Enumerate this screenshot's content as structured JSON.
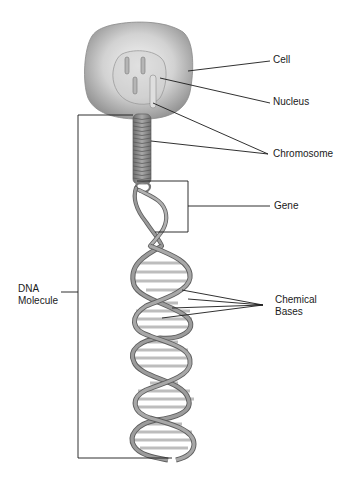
{
  "diagram": {
    "type": "biology-labeled-illustration",
    "colors": {
      "cell_fill_outer": "#9a9a9a",
      "cell_fill_inner": "#efefef",
      "strand": "#8c8c8c",
      "strand_edge": "#5e5e5e",
      "base_pair": "#c4c4c4",
      "leader_line": "#1a1a1a",
      "background": "#ffffff"
    },
    "labels": {
      "cell": "Cell",
      "nucleus": "Nucleus",
      "chromosome": "Chromosome",
      "gene": "Gene",
      "chemical_bases_line1": "Chemical",
      "chemical_bases_line2": "Bases",
      "dna_molecule_line1": "DNA",
      "dna_molecule_line2": "Molecule"
    }
  }
}
